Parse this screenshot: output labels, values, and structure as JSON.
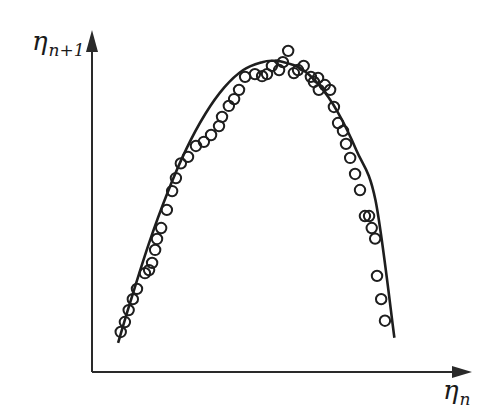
{
  "chart_data": {
    "type": "scatter",
    "title": "",
    "xlabel": "η_n",
    "ylabel": "η_{n+1}",
    "xlabel_parts": {
      "main": "η",
      "sub": "n"
    },
    "ylabel_parts": {
      "main": "η",
      "sub": "n+1"
    },
    "xlim": [
      0,
      1
    ],
    "ylim": [
      0,
      1
    ],
    "grid": false,
    "legend": "none",
    "axis_ticks": "none",
    "series": [
      {
        "name": "measured",
        "kind": "scatter",
        "marker": "open-circle",
        "x": [
          0.076,
          0.087,
          0.097,
          0.108,
          0.119,
          0.14,
          0.151,
          0.159,
          0.167,
          0.172,
          0.183,
          0.198,
          0.212,
          0.222,
          0.235,
          0.254,
          0.275,
          0.296,
          0.315,
          0.336,
          0.344,
          0.362,
          0.376,
          0.389,
          0.405,
          0.431,
          0.45,
          0.463,
          0.476,
          0.495,
          0.505,
          0.519,
          0.534,
          0.545,
          0.56,
          0.579,
          0.587,
          0.598,
          0.6,
          0.616,
          0.63,
          0.64,
          0.651,
          0.664,
          0.672,
          0.683,
          0.696,
          0.709,
          0.722,
          0.733,
          0.74,
          0.749,
          0.754,
          0.765,
          0.775
        ],
        "y": [
          0.117,
          0.146,
          0.181,
          0.213,
          0.243,
          0.289,
          0.298,
          0.319,
          0.357,
          0.389,
          0.421,
          0.474,
          0.529,
          0.567,
          0.61,
          0.629,
          0.661,
          0.673,
          0.693,
          0.719,
          0.746,
          0.778,
          0.798,
          0.825,
          0.863,
          0.871,
          0.865,
          0.871,
          0.895,
          0.883,
          0.906,
          0.939,
          0.874,
          0.883,
          0.895,
          0.863,
          0.848,
          0.86,
          0.825,
          0.839,
          0.825,
          0.775,
          0.728,
          0.705,
          0.667,
          0.626,
          0.579,
          0.532,
          0.456,
          0.456,
          0.421,
          0.39,
          0.281,
          0.213,
          0.15
        ]
      },
      {
        "name": "fit",
        "kind": "line",
        "x": [
          0.069,
          0.1,
          0.15,
          0.2,
          0.25,
          0.3,
          0.35,
          0.4,
          0.45,
          0.48,
          0.5,
          0.55,
          0.6,
          0.65,
          0.7,
          0.75,
          0.8
        ],
        "y": [
          0.085,
          0.2,
          0.374,
          0.525,
          0.653,
          0.755,
          0.832,
          0.883,
          0.906,
          0.91,
          0.908,
          0.889,
          0.84,
          0.76,
          0.647,
          0.502,
          0.1
        ]
      }
    ]
  }
}
